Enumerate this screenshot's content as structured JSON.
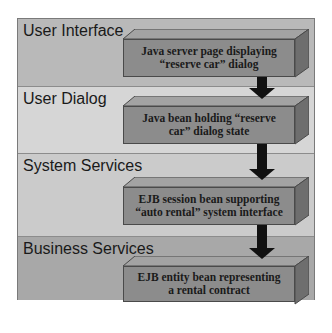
{
  "diagram": {
    "type": "layered-architecture",
    "layers": [
      {
        "label": "User Interface",
        "color": "#b9b9b9",
        "component": {
          "line1": "Java server page displaying",
          "line2": "“reserve car” dialog"
        }
      },
      {
        "label": "User Dialog",
        "color": "#d6d6d6",
        "component": {
          "line1": "Java bean holding “reserve",
          "line2": "car” dialog state"
        }
      },
      {
        "label": "System Services",
        "color": "#cbcbcb",
        "component": {
          "line1": "EJB session bean supporting",
          "line2": "“auto rental” system interface"
        }
      },
      {
        "label": "Business Services",
        "color": "#a8a8a8",
        "component": {
          "line1": "EJB entity bean representing",
          "line2": "a rental contract"
        }
      }
    ],
    "arrows": [
      "down",
      "down",
      "down"
    ],
    "box_color": "#8c8c8c",
    "arrow_color": "#111111"
  }
}
